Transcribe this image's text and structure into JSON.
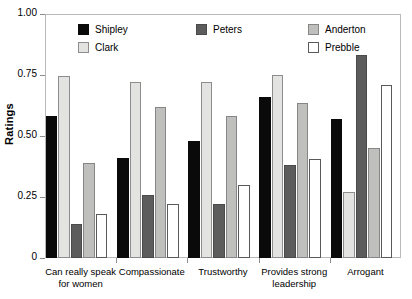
{
  "chart_data": {
    "type": "bar",
    "title": "",
    "xlabel": "",
    "ylabel": "Ratings",
    "ylim": [
      0,
      1.0
    ],
    "yticks": [
      "0",
      "0.25",
      "0.50",
      "0.75",
      "1.00"
    ],
    "ytick_values": [
      0,
      0.25,
      0.5,
      0.75,
      1.0
    ],
    "grid": false,
    "legend_position": "top-inside",
    "categories": [
      "Can really speak for women",
      "Compassionate",
      "Trustworthy",
      "Provides strong leadership",
      "Arrogant"
    ],
    "category_lines": [
      [
        "Can really speak",
        "for women"
      ],
      [
        "Compassionate"
      ],
      [
        "Trustworthy"
      ],
      [
        "Provides strong",
        "leadership"
      ],
      [
        "Arrogant"
      ]
    ],
    "series": [
      {
        "name": "Shipley",
        "color": "#0a0a0a",
        "values": [
          0.58,
          0.41,
          0.48,
          0.66,
          0.57
        ]
      },
      {
        "name": "Clark",
        "color": "#e3e3e1",
        "values": [
          0.745,
          0.72,
          0.72,
          0.75,
          0.27
        ]
      },
      {
        "name": "Peters",
        "color": "#5c5c5c",
        "values": [
          0.14,
          0.26,
          0.22,
          0.38,
          0.83
        ]
      },
      {
        "name": "Anderton",
        "color": "#bfbfbd",
        "values": [
          0.39,
          0.62,
          0.58,
          0.635,
          0.45
        ]
      },
      {
        "name": "Prebble",
        "color": "#ffffff",
        "values": [
          0.18,
          0.22,
          0.3,
          0.405,
          0.71
        ]
      }
    ]
  },
  "legend": {
    "entries": [
      {
        "label": "Shipley",
        "key": "shipley"
      },
      {
        "label": "Clark",
        "key": "clark"
      },
      {
        "label": "Peters",
        "key": "peters"
      },
      {
        "label": "Anderton",
        "key": "anderton"
      },
      {
        "label": "Prebble",
        "key": "prebble"
      }
    ]
  }
}
